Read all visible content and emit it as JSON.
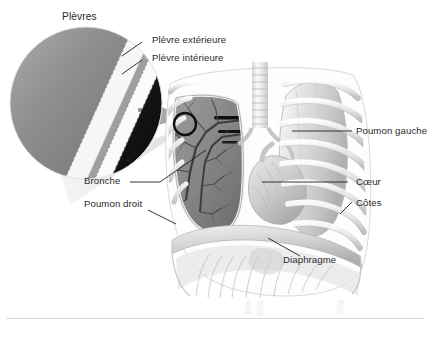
{
  "figure": {
    "title_label": "Plèvres",
    "language": "fr",
    "background_color": "#ffffff",
    "label_color": "#2a2a2a",
    "leader_line_color": "#1a1a1a"
  },
  "labels": {
    "plevres": "Plèvres",
    "plevre_exterieure": "Plèvre extérieure",
    "plevre_interieure": "Plèvre intérieure",
    "bronche": "Bronche",
    "poumon_droit": "Poumon droit",
    "poumon_gauche": "Poumon gauche",
    "coeur": "Cœur",
    "cotes": "Côtes",
    "diaphragme": "Diaphragme"
  },
  "callout": {
    "magnifier_marker": "black-circle-marker",
    "layers": [
      {
        "name": "paroi-thoracique",
        "color": "#8e8e8e"
      },
      {
        "name": "plevre-exterieure",
        "color": "#f2f2f2"
      },
      {
        "name": "espace-pleural",
        "color": "#9a9a9a"
      },
      {
        "name": "plevre-interieure",
        "color": "#fafafa"
      },
      {
        "name": "poumon",
        "color": "#171717"
      }
    ]
  },
  "caption": {
    "text": ""
  }
}
